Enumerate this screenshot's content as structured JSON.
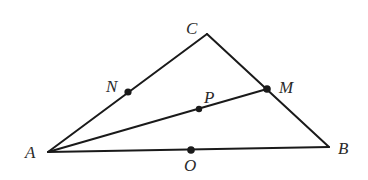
{
  "diagram": {
    "type": "geometry-triangle",
    "colors": {
      "stroke": "#1a1a1a",
      "label": "#2a2a2a",
      "background": "#ffffff"
    },
    "vertices": {
      "A": {
        "x": 48,
        "y": 152,
        "label": "A"
      },
      "B": {
        "x": 329,
        "y": 147,
        "label": "B"
      },
      "C": {
        "x": 207,
        "y": 34,
        "label": "C"
      }
    },
    "points": {
      "N": {
        "x": 128,
        "y": 92,
        "label": "N",
        "on": "AC"
      },
      "M": {
        "x": 267,
        "y": 89,
        "label": "M",
        "on": "CB"
      },
      "P": {
        "x": 199,
        "y": 109,
        "label": "P",
        "on": "AM"
      },
      "O": {
        "x": 191,
        "y": 150,
        "label": "O",
        "on": "AB"
      }
    },
    "segments": [
      "AC",
      "CB",
      "AB",
      "AM"
    ],
    "labels": {
      "A": "A",
      "B": "B",
      "C": "C",
      "N": "N",
      "M": "M",
      "P": "P",
      "O": "O"
    }
  }
}
